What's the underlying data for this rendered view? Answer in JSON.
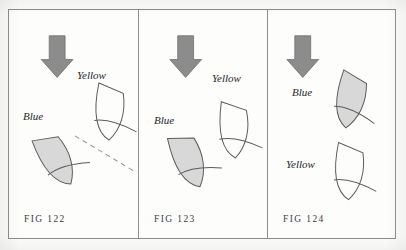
{
  "plate": {
    "background_color": "#fbfbf9",
    "frame_color": "#8d8d8d",
    "panel_count": 3
  },
  "style": {
    "arrow_fill": "#8c8c8c",
    "arrow_stroke": "#6f6f6f",
    "shaded_shape_fill": "#d8d8d8",
    "shape_stroke": "#5b5b5b",
    "dashed_line_color": "#9a9a9a",
    "caption_color": "#3c3c3c",
    "label_color": "#26262a"
  },
  "panels": [
    {
      "id": "panel-1",
      "caption": "FIG 122",
      "arrow": {
        "name": "down-arrow",
        "direction": "down",
        "x": 48,
        "y": 26
      },
      "shapes": [
        {
          "name": "blue-shape",
          "label": "Blue",
          "label_x": 14,
          "label_y": 100,
          "shaded": true,
          "cx": 48,
          "cy": 152,
          "rotation": -22
        },
        {
          "name": "yellow-shape",
          "label": "Yellow",
          "label_x": 68,
          "label_y": 59,
          "shaded": false,
          "cx": 101,
          "cy": 104,
          "rotation": 10
        }
      ],
      "dashed_line": {
        "name": "projection-line",
        "x1": 66,
        "y1": 127,
        "x2": 128,
        "y2": 164
      }
    },
    {
      "id": "panel-2",
      "caption": "FIG 123",
      "arrow": {
        "name": "down-arrow",
        "direction": "down",
        "x": 47,
        "y": 26
      },
      "shapes": [
        {
          "name": "blue-shape",
          "label": "Blue",
          "label_x": 15,
          "label_y": 104,
          "shaded": true,
          "cx": 51,
          "cy": 153,
          "rotation": -14
        },
        {
          "name": "yellow-shape",
          "label": "Yellow",
          "label_x": 73,
          "label_y": 62,
          "shaded": false,
          "cx": 96,
          "cy": 122,
          "rotation": 6
        }
      ],
      "dashed_line": null
    },
    {
      "id": "panel-3",
      "caption": "FIG 124",
      "arrow": {
        "name": "down-arrow",
        "direction": "down",
        "x": 35,
        "y": 26
      },
      "shapes": [
        {
          "name": "blue-shape",
          "label": "Blue",
          "label_x": 24,
          "label_y": 76,
          "shaded": true,
          "cx": 83,
          "cy": 92,
          "rotation": 18
        },
        {
          "name": "yellow-shape",
          "label": "Yellow",
          "label_x": 18,
          "label_y": 148,
          "shaded": false,
          "cx": 82,
          "cy": 164,
          "rotation": 10
        }
      ],
      "dashed_line": null
    }
  ]
}
